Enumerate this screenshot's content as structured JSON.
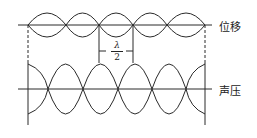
{
  "diagram": {
    "title": "",
    "labels": {
      "displacement": "位移",
      "pressure": "声压",
      "spacing_numerator": "λ",
      "spacing_denominator": "2"
    },
    "colors": {
      "line": "#2a2a2a",
      "background": "#ffffff"
    },
    "displacement_wave": {
      "axis_y": 25,
      "amplitude": 12,
      "nodes_x": [
        28,
        66,
        99,
        133,
        167,
        205
      ]
    },
    "pressure_wave": {
      "axis_y": 89,
      "amplitude": 25,
      "nodes_x": [
        48,
        83,
        118,
        152,
        186
      ],
      "end_walls_x": [
        28,
        205
      ]
    },
    "half_wavelength_marker": {
      "x1": 99,
      "x2": 133
    }
  }
}
